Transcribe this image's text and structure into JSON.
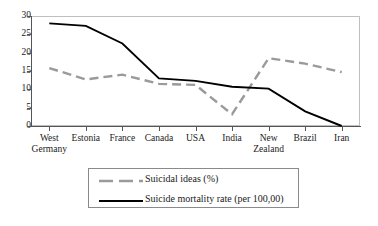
{
  "chart_data": {
    "type": "line",
    "title": "",
    "subtitle": "",
    "xlabel": "",
    "ylabel": "",
    "ylim": [
      0,
      30
    ],
    "yticks": [
      0,
      5,
      10,
      15,
      20,
      25,
      30
    ],
    "grid": false,
    "legend_position": "bottom",
    "categories": [
      "West Germany",
      "Estonia",
      "France",
      "Canada",
      "USA",
      "India",
      "New Zealand",
      "Brazil",
      "Iran"
    ],
    "category_lines": [
      [
        "West",
        "Germany"
      ],
      [
        "Estonia",
        ""
      ],
      [
        "France",
        ""
      ],
      [
        "Canada",
        ""
      ],
      [
        "USA",
        ""
      ],
      [
        "India",
        ""
      ],
      [
        "New",
        "Zealand"
      ],
      [
        "Brazil",
        ""
      ],
      [
        "Iran",
        ""
      ]
    ],
    "series": [
      {
        "name": "Suicidal ideas (%)",
        "color": "#9a9a9a",
        "style": "dashed",
        "values": [
          15.8,
          12.7,
          14.0,
          11.5,
          11.2,
          3.2,
          18.5,
          17.0,
          14.7
        ]
      },
      {
        "name": "Suicide mortality rate (per 100,00)",
        "color": "#000000",
        "style": "solid",
        "values": [
          28.0,
          27.3,
          22.5,
          13.0,
          12.3,
          10.7,
          10.2,
          4.0,
          0.0
        ]
      }
    ]
  },
  "axis": {
    "y_tick_labels": [
      "30",
      "25",
      "20",
      "15",
      "10",
      "5",
      "0"
    ]
  },
  "legend": {
    "items": [
      {
        "label": "Suicidal ideas (%)",
        "swatch": "dashed-gray-line-icon"
      },
      {
        "label": "Suicide mortality rate (per 100,00)",
        "swatch": "solid-black-line-icon"
      }
    ]
  }
}
